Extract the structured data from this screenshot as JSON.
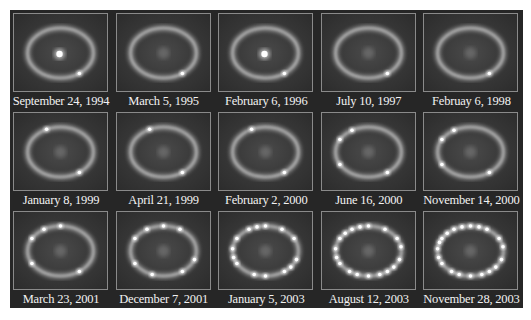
{
  "figure": {
    "panels": [
      {
        "date": "September 24, 1994",
        "central_bright": true,
        "spots": 1
      },
      {
        "date": "March 5, 1995",
        "central_bright": false,
        "spots": 1
      },
      {
        "date": "February 6, 1996",
        "central_bright": true,
        "spots": 1
      },
      {
        "date": "July 10, 1997",
        "central_bright": false,
        "spots": 1
      },
      {
        "date": "Februay 6, 1998",
        "central_bright": false,
        "spots": 1
      },
      {
        "date": "January 8, 1999",
        "central_bright": false,
        "spots": 2
      },
      {
        "date": "April 21, 1999",
        "central_bright": false,
        "spots": 2
      },
      {
        "date": "February 2, 2000",
        "central_bright": false,
        "spots": 2
      },
      {
        "date": "June 16, 2000",
        "central_bright": false,
        "spots": 4
      },
      {
        "date": "November 14, 2000",
        "central_bright": false,
        "spots": 4
      },
      {
        "date": "March 23, 2001",
        "central_bright": false,
        "spots": 5
      },
      {
        "date": "December 7, 2001",
        "central_bright": false,
        "spots": 8
      },
      {
        "date": "January 5, 2003",
        "central_bright": false,
        "spots": 14
      },
      {
        "date": "August 12, 2003",
        "central_bright": false,
        "spots": 18
      },
      {
        "date": "November 28, 2003",
        "central_bright": false,
        "spots": 20
      }
    ],
    "colors": {
      "background": "#262626",
      "frame_border": "#8a8a8a",
      "label_text": "#f2f2f2",
      "ring": "#bdbdbd",
      "spot": "#ffffff"
    }
  }
}
